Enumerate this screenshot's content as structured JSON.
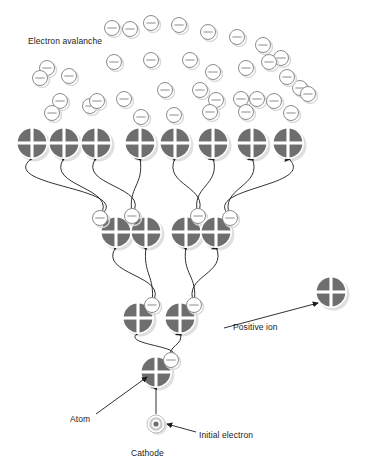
{
  "figure": {
    "background": "#ffffff"
  },
  "labels": {
    "avalanche": "Electron avalanche",
    "positive_ion": "Positive ion",
    "atom": "Atom",
    "initial_electron": "Initial electron",
    "cathode": "Cathode"
  },
  "colors": {
    "atom_fill": "#6e6e6e",
    "atom_cross": "#ffffff",
    "atom_outline": "#ffffff",
    "shadow": "#d9d9d9",
    "electron_fill": "#ffffff",
    "electron_stroke": "#8c8c8c",
    "line": "#1a1a1a",
    "text": "#1a1a1a",
    "cathode_outer": "#c9c9c9",
    "cathode_mid": "#ffffff",
    "cathode_core": "#6e6e6e"
  },
  "symbols": {
    "atom_icon": "circle-with-white-cross",
    "electron_icon": "circle-with-minus",
    "cathode_icon": "concentric-ring-dot"
  },
  "chart_data": {
    "type": "diagram",
    "title": "Electron avalanche",
    "cathode": {
      "x": 156,
      "y": 424,
      "r": 9
    },
    "atom_radius": 16,
    "electron_radius": 7.5,
    "atom_rows": [
      {
        "generation": 4,
        "y": 143,
        "atoms": [
          {
            "x": 32,
            "electron": null
          },
          {
            "x": 64,
            "electron": null
          },
          {
            "x": 96,
            "electron": null
          },
          {
            "x": 140,
            "electron": null
          },
          {
            "x": 175,
            "electron": null
          },
          {
            "x": 213,
            "electron": null
          },
          {
            "x": 252,
            "electron": null
          },
          {
            "x": 288,
            "electron": null
          }
        ]
      },
      {
        "generation": 3,
        "y": 232,
        "atoms": [
          {
            "x": 116,
            "electron": {
              "dx": -16,
              "dy": -14
            }
          },
          {
            "x": 146,
            "electron": {
              "dx": -14,
              "dy": -16
            }
          },
          {
            "x": 186,
            "electron": {
              "dx": 12,
              "dy": -16
            }
          },
          {
            "x": 216,
            "electron": {
              "dx": 14,
              "dy": -14
            }
          }
        ]
      },
      {
        "generation": 2,
        "y": 318,
        "atoms": [
          {
            "x": 138,
            "electron": {
              "dx": 14,
              "dy": -13
            }
          },
          {
            "x": 180,
            "electron": {
              "dx": 14,
              "dy": -13
            }
          }
        ]
      },
      {
        "generation": 1,
        "y": 372,
        "atoms": [
          {
            "x": 156,
            "electron": {
              "dx": 15,
              "dy": -12
            }
          }
        ]
      }
    ],
    "free_electrons": [
      {
        "x": 112,
        "y": 28
      },
      {
        "x": 130,
        "y": 29
      },
      {
        "x": 151,
        "y": 23
      },
      {
        "x": 179,
        "y": 25
      },
      {
        "x": 208,
        "y": 32
      },
      {
        "x": 237,
        "y": 37
      },
      {
        "x": 263,
        "y": 45
      },
      {
        "x": 281,
        "y": 58
      },
      {
        "x": 47,
        "y": 68
      },
      {
        "x": 69,
        "y": 76
      },
      {
        "x": 114,
        "y": 62
      },
      {
        "x": 151,
        "y": 60
      },
      {
        "x": 190,
        "y": 60
      },
      {
        "x": 213,
        "y": 72
      },
      {
        "x": 246,
        "y": 68
      },
      {
        "x": 269,
        "y": 62
      },
      {
        "x": 300,
        "y": 88
      },
      {
        "x": 40,
        "y": 78
      },
      {
        "x": 60,
        "y": 101
      },
      {
        "x": 90,
        "y": 106
      },
      {
        "x": 97,
        "y": 101
      },
      {
        "x": 124,
        "y": 99
      },
      {
        "x": 165,
        "y": 90
      },
      {
        "x": 200,
        "y": 90
      },
      {
        "x": 216,
        "y": 100
      },
      {
        "x": 241,
        "y": 99
      },
      {
        "x": 257,
        "y": 99
      },
      {
        "x": 274,
        "y": 101
      },
      {
        "x": 287,
        "y": 77
      },
      {
        "x": 141,
        "y": 117
      },
      {
        "x": 174,
        "y": 115
      },
      {
        "x": 210,
        "y": 112
      },
      {
        "x": 246,
        "y": 112
      },
      {
        "x": 291,
        "y": 113
      },
      {
        "x": 308,
        "y": 94
      },
      {
        "x": 52,
        "y": 113
      }
    ],
    "positive_ion": {
      "x": 331,
      "y": 292,
      "r": 16
    },
    "pointer_lines": [
      {
        "from": [
          224,
          328
        ],
        "to": [
          318,
          303
        ],
        "label": "Positive ion"
      },
      {
        "from": [
          96,
          414
        ],
        "to": [
          147,
          377
        ],
        "label": "Atom"
      },
      {
        "from": [
          196,
          432
        ],
        "to": [
          167,
          424
        ],
        "label": "Initial electron"
      }
    ]
  }
}
